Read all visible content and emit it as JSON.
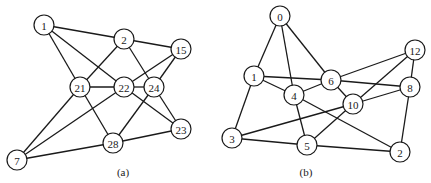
{
  "graphs": [
    {
      "caption": "(a)",
      "caption_pos": [
        123,
        176
      ],
      "node_radius": 10,
      "nodes": [
        {
          "id": "1",
          "x": 44,
          "y": 25
        },
        {
          "id": "2",
          "x": 124,
          "y": 39
        },
        {
          "id": "15",
          "x": 181,
          "y": 49
        },
        {
          "id": "21",
          "x": 80,
          "y": 87
        },
        {
          "id": "22",
          "x": 124,
          "y": 87
        },
        {
          "id": "24",
          "x": 154,
          "y": 87
        },
        {
          "id": "23",
          "x": 181,
          "y": 129
        },
        {
          "id": "28",
          "x": 113,
          "y": 143
        },
        {
          "id": "7",
          "x": 17,
          "y": 160
        }
      ],
      "edges": [
        [
          "1",
          "2"
        ],
        [
          "1",
          "21"
        ],
        [
          "1",
          "22"
        ],
        [
          "2",
          "15"
        ],
        [
          "2",
          "21"
        ],
        [
          "2",
          "24"
        ],
        [
          "15",
          "22"
        ],
        [
          "15",
          "24"
        ],
        [
          "21",
          "22"
        ],
        [
          "22",
          "24"
        ],
        [
          "21",
          "7"
        ],
        [
          "21",
          "28"
        ],
        [
          "22",
          "7"
        ],
        [
          "22",
          "23"
        ],
        [
          "24",
          "23"
        ],
        [
          "24",
          "28"
        ],
        [
          "28",
          "7"
        ],
        [
          "28",
          "23"
        ]
      ]
    },
    {
      "caption": "(b)",
      "caption_pos": [
        306,
        176
      ],
      "node_radius": 10,
      "nodes": [
        {
          "id": "0",
          "x": 280,
          "y": 16
        },
        {
          "id": "1",
          "x": 254,
          "y": 76
        },
        {
          "id": "4",
          "x": 294,
          "y": 95
        },
        {
          "id": "6",
          "x": 331,
          "y": 80
        },
        {
          "id": "12",
          "x": 415,
          "y": 50
        },
        {
          "id": "8",
          "x": 410,
          "y": 87
        },
        {
          "id": "10",
          "x": 353,
          "y": 104
        },
        {
          "id": "3",
          "x": 232,
          "y": 138
        },
        {
          "id": "5",
          "x": 307,
          "y": 145
        },
        {
          "id": "2",
          "x": 400,
          "y": 152
        }
      ],
      "edges": [
        [
          "0",
          "1"
        ],
        [
          "0",
          "4"
        ],
        [
          "0",
          "6"
        ],
        [
          "1",
          "6"
        ],
        [
          "1",
          "4"
        ],
        [
          "1",
          "3"
        ],
        [
          "4",
          "6"
        ],
        [
          "4",
          "5"
        ],
        [
          "4",
          "2"
        ],
        [
          "6",
          "12"
        ],
        [
          "6",
          "8"
        ],
        [
          "6",
          "10"
        ],
        [
          "12",
          "10"
        ],
        [
          "12",
          "8"
        ],
        [
          "8",
          "10"
        ],
        [
          "8",
          "2"
        ],
        [
          "10",
          "3"
        ],
        [
          "10",
          "5"
        ],
        [
          "3",
          "5"
        ],
        [
          "5",
          "2"
        ]
      ]
    }
  ]
}
